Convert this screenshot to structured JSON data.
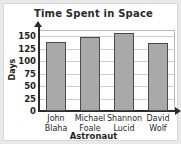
{
  "chart_data": {
    "type": "bar",
    "title": "Time Spent in Space",
    "xlabel": "Astronaut",
    "ylabel": "Days",
    "categories": [
      "John Blaha",
      "Michael Foale",
      "Shannon Lucid",
      "David Wolf"
    ],
    "category_lines": [
      [
        "John",
        "Blaha"
      ],
      [
        "Michael",
        "Foale"
      ],
      [
        "Shannon",
        "Lucid"
      ],
      [
        "David",
        "Wolf"
      ]
    ],
    "values": [
      138,
      148,
      157,
      136
    ],
    "ylim": [
      0,
      162
    ],
    "yticks": [
      150,
      125,
      100,
      75,
      50,
      25,
      0
    ],
    "ytick_labels": [
      "150",
      "125",
      "100",
      "75",
      "50",
      "25",
      "0"
    ],
    "grid": true,
    "legend": null,
    "bar_color": "#a9a9a9",
    "bar_border_color": "#4a4a4a",
    "axis_color": "#2b2b2b",
    "grid_color": "#cfcfcf",
    "background": "#ffffff"
  }
}
